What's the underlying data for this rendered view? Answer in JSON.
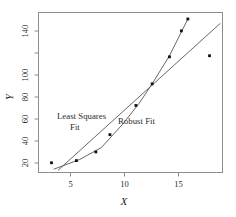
{
  "chart_data": {
    "type": "scatter",
    "title": "",
    "xlabel": "X",
    "ylabel": "Y",
    "xlim": [
      2.2,
      19.2
    ],
    "ylim": [
      10,
      158
    ],
    "grid": false,
    "legend_position": "inline-annotation",
    "xticks": [
      5,
      10,
      15
    ],
    "yticks": [
      20,
      40,
      60,
      80,
      100,
      140
    ],
    "xtick_labels": [
      "5",
      "10",
      "15"
    ],
    "ytick_labels": [
      "20",
      "40",
      "60",
      "80",
      "100",
      "140"
    ],
    "series": [
      {
        "name": "Observations",
        "type": "scatter",
        "marker": "filled-square",
        "color": "#111111",
        "points": [
          {
            "x": 3.4,
            "y": 19
          },
          {
            "x": 5.7,
            "y": 21
          },
          {
            "x": 7.5,
            "y": 29
          },
          {
            "x": 8.8,
            "y": 45
          },
          {
            "x": 11.2,
            "y": 72
          },
          {
            "x": 12.7,
            "y": 92
          },
          {
            "x": 14.3,
            "y": 117
          },
          {
            "x": 15.4,
            "y": 141
          },
          {
            "x": 16.0,
            "y": 152
          },
          {
            "x": 18.0,
            "y": 118
          }
        ]
      },
      {
        "name": "Least Squares Fit",
        "type": "line",
        "color": "#555555",
        "description": "straight regression line pulled down by the outlier",
        "points": [
          {
            "x": 4.0,
            "y": 12
          },
          {
            "x": 19.0,
            "y": 148
          }
        ]
      },
      {
        "name": "Robust Fit",
        "type": "line",
        "color": "#555555",
        "description": "steeper fit following the bulk of the data, ignoring the outlier",
        "points": [
          {
            "x": 3.6,
            "y": 13
          },
          {
            "x": 6.0,
            "y": 22
          },
          {
            "x": 8.0,
            "y": 33
          },
          {
            "x": 10.0,
            "y": 55
          },
          {
            "x": 11.5,
            "y": 74
          },
          {
            "x": 12.7,
            "y": 92
          },
          {
            "x": 14.3,
            "y": 118
          },
          {
            "x": 15.4,
            "y": 140
          },
          {
            "x": 16.05,
            "y": 153
          }
        ]
      }
    ],
    "annotations": [
      {
        "name": "least-squares-label",
        "text_line1": "Least Squares",
        "text_line2": "Fit",
        "x": 6.0,
        "y": 60
      },
      {
        "name": "robust-label",
        "text": "Robust Fit",
        "x": 11.6,
        "y": 55
      }
    ]
  },
  "axis": {
    "x_title": "X",
    "y_title": "Y"
  },
  "annotations": {
    "least_squares_line1": "Least Squares",
    "least_squares_line2": "Fit",
    "robust": "Robust Fit"
  },
  "colors": {
    "frame": "#8d8d8d",
    "fit_line": "#555555",
    "point": "#111111",
    "text": "#2b2b2b",
    "background": "#ffffff"
  }
}
